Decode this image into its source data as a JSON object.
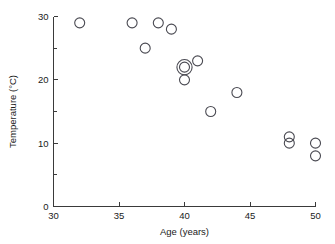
{
  "chart_data": {
    "type": "scatter",
    "title": "",
    "xlabel": "Age (years)",
    "ylabel": "Temperature (°C)",
    "xlim": [
      30,
      50
    ],
    "ylim": [
      0,
      30
    ],
    "grid": false,
    "legend": null,
    "x_ticks": [
      30,
      35,
      40,
      45,
      50
    ],
    "x_tick_labels": [
      "30",
      "35",
      "40",
      "45",
      "50"
    ],
    "x_minor_ticks": [],
    "y_ticks": [
      0,
      10,
      20,
      30
    ],
    "y_tick_labels": [
      "0",
      "10",
      "20",
      "30"
    ],
    "y_minor_ticks": [
      5,
      15,
      25
    ],
    "marker_style": "open-circle",
    "points": [
      {
        "x": 32,
        "y": 29,
        "overlap": 1
      },
      {
        "x": 36,
        "y": 29,
        "overlap": 1
      },
      {
        "x": 37,
        "y": 25,
        "overlap": 1
      },
      {
        "x": 38,
        "y": 29,
        "overlap": 1
      },
      {
        "x": 39,
        "y": 28,
        "overlap": 1
      },
      {
        "x": 40,
        "y": 22,
        "overlap": 2
      },
      {
        "x": 40,
        "y": 20,
        "overlap": 1
      },
      {
        "x": 41,
        "y": 23,
        "overlap": 1
      },
      {
        "x": 42,
        "y": 15,
        "overlap": 1
      },
      {
        "x": 44,
        "y": 18,
        "overlap": 1
      },
      {
        "x": 48,
        "y": 11,
        "overlap": 1
      },
      {
        "x": 48,
        "y": 10,
        "overlap": 1
      },
      {
        "x": 50,
        "y": 10,
        "overlap": 1
      },
      {
        "x": 50,
        "y": 8,
        "overlap": 1
      }
    ],
    "colors": {
      "marker_stroke": "#4a4a52",
      "axis": "#3a3a3a",
      "text": "#1a1a1a",
      "background": "#ffffff"
    }
  }
}
